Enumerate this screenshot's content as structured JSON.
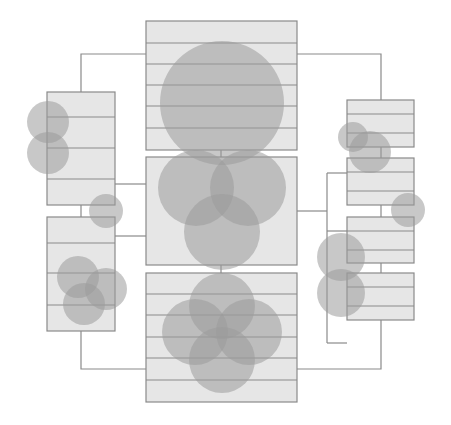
{
  "diagram": {
    "title": "",
    "colors": {
      "background": "#ffffff",
      "box_fill": "#e6e6e6",
      "box_stroke": "#8a8a8a",
      "connector": "#8a8a8a",
      "circle_fill": "#9a9a9a",
      "circle_opacity": 0.55
    },
    "boxes": [
      {
        "id": "center-top",
        "x": 146,
        "y": 21,
        "w": 151,
        "h": 129,
        "stripes": [
          43,
          64,
          85,
          106,
          128
        ]
      },
      {
        "id": "center-middle",
        "x": 146,
        "y": 157,
        "w": 151,
        "h": 108,
        "stripes": []
      },
      {
        "id": "center-bottom",
        "x": 146,
        "y": 273,
        "w": 151,
        "h": 129,
        "stripes": [
          294,
          315,
          337,
          358,
          380
        ]
      },
      {
        "id": "left-top",
        "x": 47,
        "y": 92,
        "w": 68,
        "h": 113,
        "stripes": [
          117,
          148,
          179
        ]
      },
      {
        "id": "left-bottom",
        "x": 47,
        "y": 217,
        "w": 68,
        "h": 114,
        "stripes": [
          243,
          273,
          305
        ]
      },
      {
        "id": "right-1",
        "x": 347,
        "y": 100,
        "w": 67,
        "h": 47,
        "stripes": [
          114,
          133
        ]
      },
      {
        "id": "right-2",
        "x": 347,
        "y": 158,
        "w": 67,
        "h": 47,
        "stripes": [
          172,
          191
        ]
      },
      {
        "id": "right-3",
        "x": 347,
        "y": 217,
        "w": 67,
        "h": 46,
        "stripes": [
          231,
          250
        ]
      },
      {
        "id": "right-4",
        "x": 347,
        "y": 273,
        "w": 67,
        "h": 47,
        "stripes": [
          287,
          306
        ]
      }
    ],
    "connectors": [
      "M146,54 H81 V92",
      "M297,54 H381 V100",
      "M81,331 V369 H146",
      "M381,320 V369 H297",
      "M115,184 H146",
      "M115,236 H146",
      "M297,211 H327",
      "M327,173 V343",
      "M327,173 H347",
      "M327,231 H347",
      "M327,343 H347",
      "M81,205 V217",
      "M381,147 V158",
      "M381,205 V217",
      "M381,263 V273",
      "M221,265 V273",
      "M221,150 V157"
    ],
    "circles": [
      {
        "group": "top-single",
        "cx": 222,
        "cy": 103,
        "r": 62
      },
      {
        "group": "center-triple",
        "cx": 196,
        "cy": 188,
        "r": 38
      },
      {
        "group": "center-triple",
        "cx": 248,
        "cy": 188,
        "r": 38
      },
      {
        "group": "center-triple",
        "cx": 222,
        "cy": 232,
        "r": 38
      },
      {
        "group": "bottom-quad",
        "cx": 222,
        "cy": 306,
        "r": 33
      },
      {
        "group": "bottom-quad",
        "cx": 195,
        "cy": 332,
        "r": 33
      },
      {
        "group": "bottom-quad",
        "cx": 249,
        "cy": 332,
        "r": 33
      },
      {
        "group": "bottom-quad",
        "cx": 222,
        "cy": 360,
        "r": 33
      },
      {
        "group": "left-pair",
        "cx": 48,
        "cy": 122,
        "r": 21
      },
      {
        "group": "left-pair",
        "cx": 48,
        "cy": 153,
        "r": 21
      },
      {
        "group": "left-single",
        "cx": 106,
        "cy": 211,
        "r": 17
      },
      {
        "group": "left-triple",
        "cx": 78,
        "cy": 277,
        "r": 21
      },
      {
        "group": "left-triple",
        "cx": 106,
        "cy": 289,
        "r": 21
      },
      {
        "group": "left-triple",
        "cx": 84,
        "cy": 304,
        "r": 21
      },
      {
        "group": "right-pair-diag",
        "cx": 353,
        "cy": 137,
        "r": 15
      },
      {
        "group": "right-pair-diag",
        "cx": 370,
        "cy": 152,
        "r": 21
      },
      {
        "group": "right-single",
        "cx": 408,
        "cy": 210,
        "r": 17
      },
      {
        "group": "right-pair",
        "cx": 341,
        "cy": 257,
        "r": 24
      },
      {
        "group": "right-pair",
        "cx": 341,
        "cy": 293,
        "r": 24
      }
    ]
  }
}
